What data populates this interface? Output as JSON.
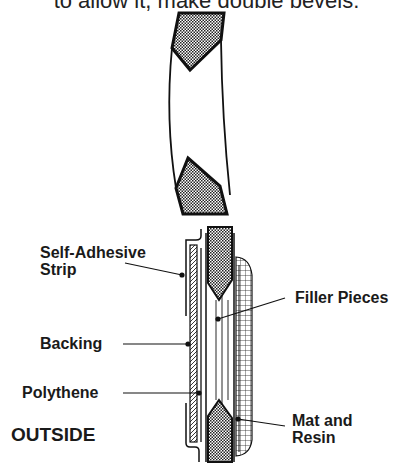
{
  "caption": {
    "text": "to allow it, make double bevels."
  },
  "figure_top": {
    "description": "Cross-section of a curved hull wall with double-bevelled break"
  },
  "figure_bottom": {
    "labels": {
      "self_adhesive_strip": [
        "Self-Adhesive",
        "Strip"
      ],
      "backing": "Backing",
      "polythene": "Polythene",
      "outside": "OUTSIDE",
      "filler_pieces": "Filler Pieces",
      "mat_and_resin": [
        "Mat and",
        "Resin"
      ]
    }
  },
  "colors": {
    "ink": "#1a1a1a",
    "background": "#ffffff"
  }
}
